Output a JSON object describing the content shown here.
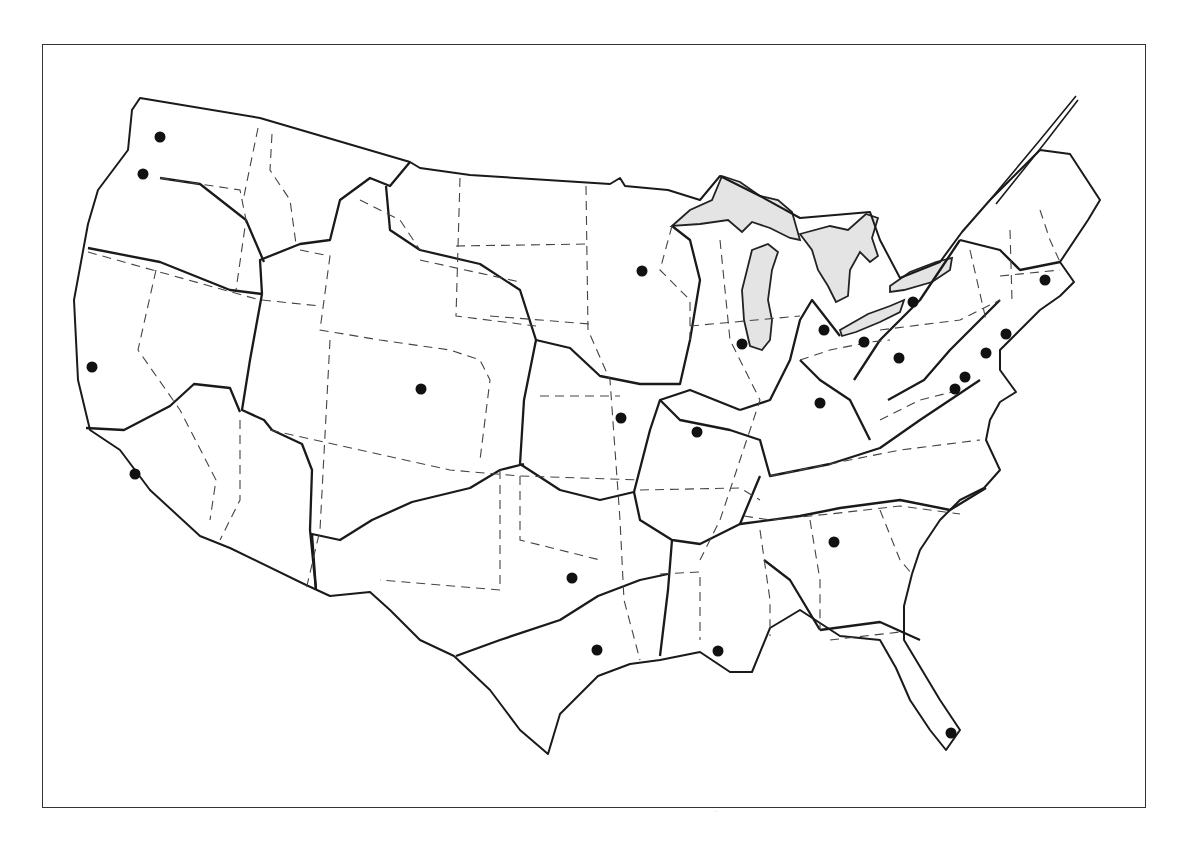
{
  "map": {
    "type": "outline map of the contiguous United States",
    "legend": null,
    "colors": {
      "lines": "#1a1a1a",
      "lakes": "#e4e4e4",
      "cities": "#111111",
      "background": "#ffffff"
    },
    "line_styles": {
      "solid_thick": "region boundaries",
      "dashed": "state boundaries",
      "stippled": "Great Lakes"
    },
    "cities": [
      {
        "x": 160,
        "y": 137
      },
      {
        "x": 143,
        "y": 174
      },
      {
        "x": 92,
        "y": 367
      },
      {
        "x": 135,
        "y": 474
      },
      {
        "x": 421,
        "y": 389
      },
      {
        "x": 642,
        "y": 271
      },
      {
        "x": 621,
        "y": 418
      },
      {
        "x": 697,
        "y": 432
      },
      {
        "x": 572,
        "y": 578
      },
      {
        "x": 597,
        "y": 650
      },
      {
        "x": 718,
        "y": 651
      },
      {
        "x": 742,
        "y": 344
      },
      {
        "x": 824,
        "y": 330
      },
      {
        "x": 820,
        "y": 403
      },
      {
        "x": 864,
        "y": 342
      },
      {
        "x": 913,
        "y": 302
      },
      {
        "x": 899,
        "y": 358
      },
      {
        "x": 1006,
        "y": 334
      },
      {
        "x": 986,
        "y": 353
      },
      {
        "x": 965,
        "y": 377
      },
      {
        "x": 955,
        "y": 389
      },
      {
        "x": 1045,
        "y": 280
      },
      {
        "x": 834,
        "y": 542
      },
      {
        "x": 951,
        "y": 733
      }
    ],
    "footer_mark": "·"
  }
}
